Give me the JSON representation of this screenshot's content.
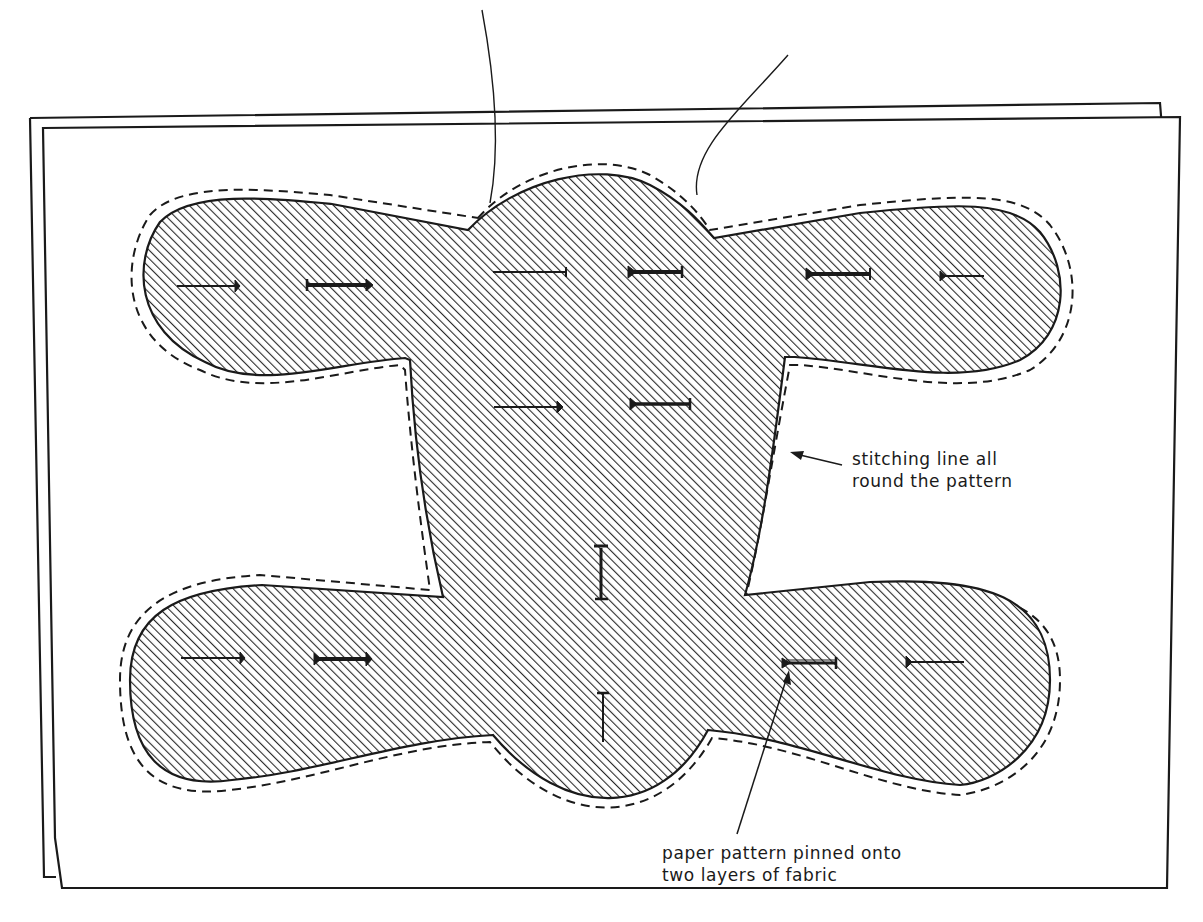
{
  "figure": {
    "colors": {
      "ink": "#1a1a1a",
      "paper": "#ffffff",
      "hatch": "#2a2a2a"
    }
  },
  "annotations": {
    "stitching_line": {
      "line1": "stitching line all",
      "line2": "round the pattern"
    },
    "paper_pattern": {
      "line1": "paper pattern pinned onto",
      "line2": "two layers of fabric"
    }
  },
  "elements": {
    "fabric_layers": 2,
    "pins_horizontal": 12,
    "pins_vertical": 2,
    "threads": 2
  }
}
